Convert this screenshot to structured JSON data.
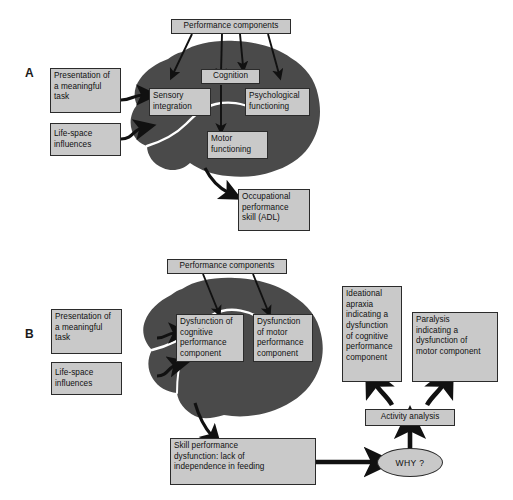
{
  "figure": {
    "colors": {
      "brain_fill": "#4a4a4a",
      "box_fill": "#c9c9c9",
      "box_border": "#2b2b2b",
      "arrow": "#111111",
      "background": "#ffffff"
    }
  },
  "panels": [
    {
      "id": "A",
      "label": "A",
      "boxes": {
        "performance_components": "Performance components",
        "presentation": "Presentation of\na meaningful\ntask",
        "life_space": "Life-space\ninfluences",
        "cognition": "Cognition",
        "sensory_integration": "Sensory\nintegration",
        "psychological_functioning": "Psychological\nfunctioning",
        "motor_functioning": "Motor\nfunctioning",
        "occupational_performance": "Occupational\nperformance\nskill (ADL)"
      }
    },
    {
      "id": "B",
      "label": "B",
      "boxes": {
        "performance_components": "Performance components",
        "presentation": "Presentation of\na meaningful\ntask",
        "life_space": "Life-space\ninfluences",
        "dysfunction_cognitive": "Dysfunction of\ncognitive\nperformance\ncomponent",
        "dysfunction_motor": "Dysfunction\nof motor\nperformance\ncomponent",
        "skill_performance_dysfunction": "Skill performance\ndysfunction: lack of\nindependence in feeding",
        "why": "WHY ?",
        "activity_analysis": "Activity analysis",
        "ideational_apraxia": "Ideational\napraxia\nindicating a\ndysfunction\nof cognitive\nperformance\ncomponent",
        "paralysis": "Paralysis\nindicating a\ndysfunction of\nmotor component"
      }
    }
  ]
}
